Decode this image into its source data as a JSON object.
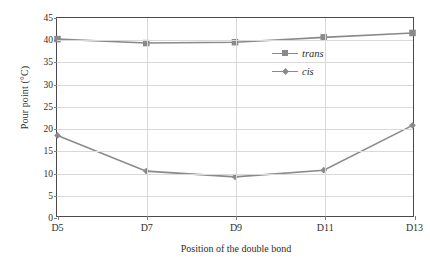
{
  "chart_data": {
    "type": "line",
    "title": "",
    "xlabel": "Position of the double bond",
    "ylabel": "Pour point (°C)",
    "categories": [
      "D5",
      "D7",
      "D9",
      "D11",
      "D13"
    ],
    "ylim": [
      0,
      45
    ],
    "ytick_step": 5,
    "yticks": [
      "0",
      "5",
      "10",
      "15",
      "20",
      "25",
      "30",
      "35",
      "40",
      "45"
    ],
    "grid": true,
    "legend_position": "inside-right",
    "series": [
      {
        "name": "trans",
        "marker": "square",
        "color": "#8a8a8a",
        "values": [
          40.2,
          39.3,
          39.5,
          40.6,
          41.6
        ]
      },
      {
        "name": "cis",
        "marker": "diamond",
        "color": "#8a8a8a",
        "values": [
          18.3,
          10.2,
          8.9,
          10.4,
          20.6
        ]
      }
    ]
  },
  "legend": {
    "items": [
      {
        "label": "trans",
        "marker": "square-marker-icon"
      },
      {
        "label": "cis",
        "marker": "diamond-marker-icon"
      }
    ]
  },
  "colors": {
    "series": "#8a8a8a",
    "gridline": "#d9d9d9",
    "axis": "#4a4a4a",
    "text": "#2e2e2e",
    "background": "#ffffff"
  }
}
